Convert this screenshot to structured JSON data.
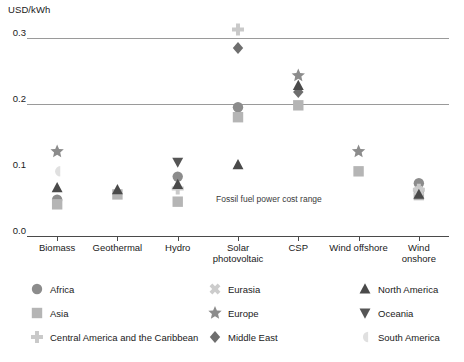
{
  "chart_data": {
    "type": "scatter",
    "title": "",
    "ylabel": "USD/kWh",
    "xlabel": "",
    "ylim": [
      0.0,
      0.32
    ],
    "yticks": [
      "0.0",
      "0.1",
      "0.2",
      "0.3"
    ],
    "ytick_values": [
      0.0,
      0.1,
      0.2,
      0.3
    ],
    "grid": "horizontal gridlines at 0.2 and 0.3",
    "legend_position": "below-plot",
    "categories": [
      "Biomass",
      "Geothermal",
      "Hydro",
      "Solar\nphotovoltaic",
      "CSP",
      "Wind offshore",
      "Wind\nonshore"
    ],
    "annotations": [
      {
        "text": "Fossil fuel power cost range",
        "x_category": "Solar photovoltaic",
        "y": 0.055
      }
    ],
    "series": [
      {
        "name": "Africa",
        "marker": "circle",
        "color": "#8c8c8c",
        "points": [
          {
            "c": "Biomass",
            "v": 0.055
          },
          {
            "c": "Geothermal",
            "v": null
          },
          {
            "c": "Hydro",
            "v": 0.09
          },
          {
            "c": "Solar photovoltaic",
            "v": 0.195
          },
          {
            "c": "CSP",
            "v": null
          },
          {
            "c": "Wind offshore",
            "v": null
          },
          {
            "c": "Wind onshore",
            "v": 0.08
          }
        ]
      },
      {
        "name": "Asia",
        "marker": "square",
        "color": "#b5b5b5",
        "points": [
          {
            "c": "Biomass",
            "v": 0.048
          },
          {
            "c": "Geothermal",
            "v": 0.063
          },
          {
            "c": "Hydro",
            "v": 0.052
          },
          {
            "c": "Solar photovoltaic",
            "v": 0.18
          },
          {
            "c": "CSP",
            "v": 0.198
          },
          {
            "c": "Wind offshore",
            "v": 0.098
          },
          {
            "c": "Wind onshore",
            "v": 0.062
          }
        ]
      },
      {
        "name": "Central America and the Caribbean",
        "marker": "plus",
        "color": "#c9c9c9",
        "points": [
          {
            "c": "Biomass",
            "v": null
          },
          {
            "c": "Geothermal",
            "v": null
          },
          {
            "c": "Hydro",
            "v": 0.072
          },
          {
            "c": "Solar photovoltaic",
            "v": 0.313
          },
          {
            "c": "CSP",
            "v": null
          },
          {
            "c": "Wind offshore",
            "v": null
          },
          {
            "c": "Wind onshore",
            "v": 0.07
          }
        ]
      },
      {
        "name": "Eurasia",
        "marker": "x",
        "color": "#cccccc",
        "points": [
          {
            "c": "Biomass",
            "v": null
          },
          {
            "c": "Geothermal",
            "v": null
          },
          {
            "c": "Hydro",
            "v": null
          },
          {
            "c": "Solar photovoltaic",
            "v": null
          },
          {
            "c": "CSP",
            "v": null
          },
          {
            "c": "Wind offshore",
            "v": null
          },
          {
            "c": "Wind onshore",
            "v": 0.068
          }
        ]
      },
      {
        "name": "Europe",
        "marker": "star",
        "color": "#8c8c8c",
        "points": [
          {
            "c": "Biomass",
            "v": 0.128
          },
          {
            "c": "Geothermal",
            "v": null
          },
          {
            "c": "Hydro",
            "v": null
          },
          {
            "c": "Solar photovoltaic",
            "v": null
          },
          {
            "c": "CSP",
            "v": 0.243
          },
          {
            "c": "Wind offshore",
            "v": 0.128
          },
          {
            "c": "Wind onshore",
            "v": null
          }
        ]
      },
      {
        "name": "Middle East",
        "marker": "diamond",
        "color": "#6e6e6e",
        "points": [
          {
            "c": "Biomass",
            "v": null
          },
          {
            "c": "Geothermal",
            "v": null
          },
          {
            "c": "Hydro",
            "v": null
          },
          {
            "c": "Solar photovoltaic",
            "v": 0.285
          },
          {
            "c": "CSP",
            "v": 0.218
          },
          {
            "c": "Wind offshore",
            "v": null
          },
          {
            "c": "Wind onshore",
            "v": null
          }
        ]
      },
      {
        "name": "North America",
        "marker": "triangle-up",
        "color": "#4a4a4a",
        "points": [
          {
            "c": "Biomass",
            "v": 0.073
          },
          {
            "c": "Geothermal",
            "v": 0.07
          },
          {
            "c": "Hydro",
            "v": 0.078
          },
          {
            "c": "Solar photovoltaic",
            "v": 0.108
          },
          {
            "c": "CSP",
            "v": 0.228
          },
          {
            "c": "Wind offshore",
            "v": null
          },
          {
            "c": "Wind onshore",
            "v": 0.063
          }
        ]
      },
      {
        "name": "Oceania",
        "marker": "triangle-down",
        "color": "#555555",
        "points": [
          {
            "c": "Biomass",
            "v": null
          },
          {
            "c": "Geothermal",
            "v": null
          },
          {
            "c": "Hydro",
            "v": 0.112
          },
          {
            "c": "Solar photovoltaic",
            "v": null
          },
          {
            "c": "CSP",
            "v": null
          },
          {
            "c": "Wind offshore",
            "v": null
          },
          {
            "c": "Wind onshore",
            "v": null
          }
        ]
      },
      {
        "name": "South America",
        "marker": "half-disc",
        "color": "#e0e0e0",
        "points": [
          {
            "c": "Biomass",
            "v": 0.098
          },
          {
            "c": "Geothermal",
            "v": null
          },
          {
            "c": "Hydro",
            "v": null
          },
          {
            "c": "Solar photovoltaic",
            "v": null
          },
          {
            "c": "CSP",
            "v": null
          },
          {
            "c": "Wind offshore",
            "v": null
          },
          {
            "c": "Wind onshore",
            "v": null
          }
        ]
      }
    ]
  },
  "legend": {
    "column1": [
      {
        "label": "Africa",
        "marker": "circle",
        "color": "#8c8c8c"
      },
      {
        "label": "Asia",
        "marker": "square",
        "color": "#b5b5b5"
      },
      {
        "label": "Central America and the Caribbean",
        "marker": "plus",
        "color": "#c9c9c9"
      }
    ],
    "column2": [
      {
        "label": "Eurasia",
        "marker": "x",
        "color": "#cccccc"
      },
      {
        "label": "Europe",
        "marker": "star",
        "color": "#8c8c8c"
      },
      {
        "label": "Middle East",
        "marker": "diamond",
        "color": "#6e6e6e"
      }
    ],
    "column3": [
      {
        "label": "North America",
        "marker": "triangle-up",
        "color": "#4a4a4a"
      },
      {
        "label": "Oceania",
        "marker": "triangle-down",
        "color": "#555555"
      },
      {
        "label": "South America",
        "marker": "half-disc",
        "color": "#e0e0e0"
      }
    ]
  },
  "colors": {
    "gridline": "#9a9a9a",
    "axis": "#4a4a4a",
    "text": "#1a1a1a",
    "annotation": "#3a3a3a"
  }
}
